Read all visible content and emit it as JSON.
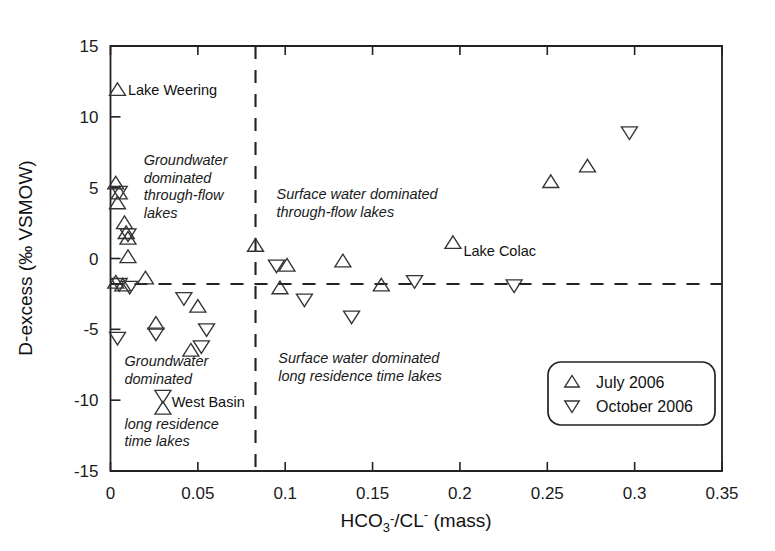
{
  "chart_data": {
    "type": "scatter",
    "title": "",
    "xlabel": "HCO3-/CL- (mass)",
    "xlabel_parts": {
      "a": "HCO",
      "sub": "3",
      "sup1": "-",
      "b": "/CL",
      "sup2": "-",
      "c": " (mass)"
    },
    "ylabel": "D-excess (‰ VSMOW)",
    "xlim": [
      0,
      0.35
    ],
    "ylim": [
      -15,
      15
    ],
    "xticks": [
      0,
      0.05,
      0.1,
      0.15,
      0.2,
      0.25,
      0.3,
      0.35
    ],
    "xticklabels": [
      "0",
      "0.05",
      "0.1",
      "0.15",
      "0.2",
      "0.25",
      "0.3",
      "0.35"
    ],
    "yticks": [
      -15,
      -10,
      -5,
      0,
      5,
      10,
      15
    ],
    "yticklabels": [
      "-15",
      "-10",
      "-5",
      "0",
      "5",
      "10",
      "15"
    ],
    "grid": false,
    "legend_position": "bottom-right",
    "reference_lines": [
      {
        "name": "d-excess-threshold",
        "orientation": "horizontal",
        "value": -1.8,
        "style": "dashed"
      },
      {
        "name": "hco3-cl-threshold",
        "orientation": "vertical",
        "value": 0.083,
        "style": "dashed"
      }
    ],
    "series": [
      {
        "name": "July 2006",
        "marker": "triangle-up",
        "points": [
          {
            "x": 0.004,
            "y": 11.9
          },
          {
            "x": 0.003,
            "y": 5.3
          },
          {
            "x": 0.005,
            "y": 4.6
          },
          {
            "x": 0.004,
            "y": 3.9
          },
          {
            "x": 0.008,
            "y": 2.5
          },
          {
            "x": 0.009,
            "y": 1.8
          },
          {
            "x": 0.01,
            "y": 1.4
          },
          {
            "x": 0.01,
            "y": 0.1
          },
          {
            "x": 0.003,
            "y": -1.7
          },
          {
            "x": 0.007,
            "y": -1.9
          },
          {
            "x": 0.02,
            "y": -1.4
          },
          {
            "x": 0.083,
            "y": 0.9
          },
          {
            "x": 0.026,
            "y": -4.6
          },
          {
            "x": 0.05,
            "y": -3.4
          },
          {
            "x": 0.046,
            "y": -6.5
          },
          {
            "x": 0.03,
            "y": -10.6
          },
          {
            "x": 0.101,
            "y": -0.5
          },
          {
            "x": 0.097,
            "y": -2.1
          },
          {
            "x": 0.133,
            "y": -0.2
          },
          {
            "x": 0.155,
            "y": -1.9
          },
          {
            "x": 0.196,
            "y": 1.1
          },
          {
            "x": 0.252,
            "y": 5.4
          },
          {
            "x": 0.273,
            "y": 6.5
          }
        ]
      },
      {
        "name": "October 2006",
        "marker": "triangle-down",
        "points": [
          {
            "x": 0.005,
            "y": 4.7
          },
          {
            "x": 0.01,
            "y": 1.7
          },
          {
            "x": 0.005,
            "y": -1.8
          },
          {
            "x": 0.011,
            "y": -2.0
          },
          {
            "x": 0.004,
            "y": -5.6
          },
          {
            "x": 0.026,
            "y": -5.3
          },
          {
            "x": 0.042,
            "y": -2.8
          },
          {
            "x": 0.055,
            "y": -5.0
          },
          {
            "x": 0.052,
            "y": -6.2
          },
          {
            "x": 0.03,
            "y": -9.7
          },
          {
            "x": 0.095,
            "y": -0.5
          },
          {
            "x": 0.111,
            "y": -2.9
          },
          {
            "x": 0.138,
            "y": -4.1
          },
          {
            "x": 0.174,
            "y": -1.6
          },
          {
            "x": 0.231,
            "y": -1.9
          },
          {
            "x": 0.297,
            "y": 8.9
          }
        ]
      }
    ],
    "annotations": [
      {
        "name": "groundwater-throughflow-label",
        "text": [
          "Groundwater",
          "dominated",
          "through-flow",
          "lakes"
        ],
        "x": 0.019,
        "y": 6.6,
        "style": "italic"
      },
      {
        "name": "surface-throughflow-label",
        "text": [
          "Surface water dominated",
          "through-flow lakes"
        ],
        "x": 0.095,
        "y": 4.2,
        "style": "italic"
      },
      {
        "name": "groundwater-longresidence-label",
        "text": [
          "Groundwater",
          "dominated"
        ],
        "x": 0.008,
        "y": -7.6,
        "style": "italic"
      },
      {
        "name": "longresidence-timelakes-label",
        "text": [
          "long residence",
          "time lakes"
        ],
        "x": 0.008,
        "y": -12.0,
        "style": "italic"
      },
      {
        "name": "surface-longresidence-label",
        "text": [
          "Surface water dominated",
          "long residence time lakes"
        ],
        "x": 0.096,
        "y": -7.4,
        "style": "italic"
      }
    ],
    "point_labels": [
      {
        "name": "lake-weering-label",
        "text": "Lake Weering",
        "x": 0.01,
        "y": 11.9
      },
      {
        "name": "lake-colac-label",
        "text": "Lake Colac",
        "x": 0.202,
        "y": 0.5
      },
      {
        "name": "west-basin-label",
        "text": "West Basin",
        "x": 0.035,
        "y": -10.1
      }
    ],
    "legend": {
      "entries": [
        {
          "name": "legend-july",
          "label": "July 2006",
          "marker": "triangle-up"
        },
        {
          "name": "legend-october",
          "label": "October 2006",
          "marker": "triangle-down"
        }
      ]
    },
    "colors": {
      "axis": "#222222",
      "marker_stroke": "#333333",
      "background": "#ffffff"
    }
  }
}
